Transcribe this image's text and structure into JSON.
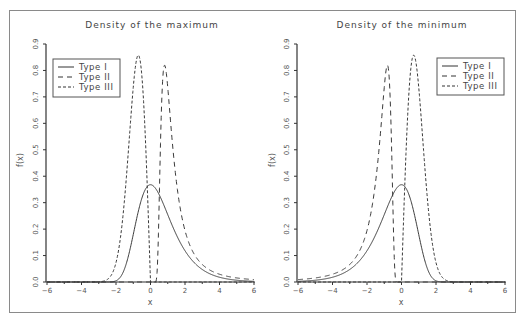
{
  "chart_data": [
    {
      "type": "line",
      "title": "Density of the maximum",
      "xlabel": "x",
      "ylabel": "f(x)",
      "xlim": [
        -6,
        6
      ],
      "ylim": [
        0,
        0.9
      ],
      "x_ticks": [
        -6,
        -4,
        -2,
        0,
        2,
        4,
        6
      ],
      "y_ticks": [
        "0.0",
        "0.1",
        "0.2",
        "0.3",
        "0.4",
        "0.5",
        "0.6",
        "0.7",
        "0.8",
        "0.9"
      ],
      "grid": false,
      "legend_position": "upper-left",
      "series": [
        {
          "name": "Type I",
          "style": "solid",
          "peak": {
            "x": 0.0,
            "y": 0.368
          },
          "x": [
            -3,
            -2,
            -1.5,
            -1,
            -0.5,
            0,
            0.5,
            1,
            1.5,
            2,
            3,
            4,
            5,
            6
          ],
          "values": [
            0.0,
            0.005,
            0.05,
            0.18,
            0.32,
            0.368,
            0.33,
            0.25,
            0.18,
            0.12,
            0.05,
            0.018,
            0.007,
            0.002
          ]
        },
        {
          "name": "Type II",
          "style": "long-dash",
          "peak": {
            "x": 0.82,
            "y": 0.82
          },
          "x": [
            0.3,
            0.4,
            0.5,
            0.6,
            0.7,
            0.82,
            1.0,
            1.2,
            1.5,
            2,
            3,
            4,
            5,
            6
          ],
          "values": [
            0.0,
            0.06,
            0.29,
            0.57,
            0.76,
            0.82,
            0.74,
            0.58,
            0.38,
            0.19,
            0.066,
            0.029,
            0.015,
            0.009
          ]
        },
        {
          "name": "Type III",
          "style": "short-dash",
          "peak": {
            "x": -0.71,
            "y": 0.86
          },
          "x": [
            -2.5,
            -2,
            -1.5,
            -1.2,
            -1,
            -0.71,
            -0.5,
            -0.3,
            0
          ],
          "values": [
            0.01,
            0.07,
            0.32,
            0.57,
            0.74,
            0.86,
            0.78,
            0.55,
            0.0
          ]
        }
      ]
    },
    {
      "type": "line",
      "title": "Density of the minimum",
      "xlabel": "x",
      "ylabel": "f(x)",
      "xlim": [
        -6,
        6
      ],
      "ylim": [
        0,
        0.9
      ],
      "x_ticks": [
        -6,
        -4,
        -2,
        0,
        2,
        4,
        6
      ],
      "y_ticks": [
        "0.0",
        "0.1",
        "0.2",
        "0.3",
        "0.4",
        "0.5",
        "0.6",
        "0.7",
        "0.8",
        "0.9"
      ],
      "grid": false,
      "legend_position": "upper-right",
      "series": [
        {
          "name": "Type I",
          "style": "solid",
          "peak": {
            "x": 0.0,
            "y": 0.368
          },
          "x": [
            -6,
            -5,
            -4,
            -3,
            -2,
            -1.5,
            -1,
            -0.5,
            0,
            0.5,
            1,
            1.5,
            2,
            3
          ],
          "values": [
            0.002,
            0.007,
            0.018,
            0.05,
            0.12,
            0.18,
            0.25,
            0.33,
            0.368,
            0.32,
            0.18,
            0.05,
            0.005,
            0.0
          ]
        },
        {
          "name": "Type II",
          "style": "long-dash",
          "peak": {
            "x": -0.82,
            "y": 0.82
          },
          "x": [
            -6,
            -5,
            -4,
            -3,
            -2,
            -1.5,
            -1.2,
            -1.0,
            -0.82,
            -0.7,
            -0.6,
            -0.5,
            -0.4,
            -0.3
          ],
          "values": [
            0.009,
            0.015,
            0.029,
            0.066,
            0.19,
            0.38,
            0.58,
            0.74,
            0.82,
            0.76,
            0.57,
            0.29,
            0.06,
            0.0
          ]
        },
        {
          "name": "Type III",
          "style": "short-dash",
          "peak": {
            "x": 0.71,
            "y": 0.86
          },
          "x": [
            0,
            0.3,
            0.5,
            0.71,
            1,
            1.2,
            1.5,
            2,
            2.5
          ],
          "values": [
            0.0,
            0.55,
            0.78,
            0.86,
            0.74,
            0.57,
            0.32,
            0.07,
            0.01
          ]
        }
      ]
    }
  ],
  "panels": [
    {
      "title": "Density of the maximum",
      "xlabel": "x",
      "ylabel": "f(x)",
      "x_tick_labels": [
        "−6",
        "−4",
        "−2",
        "0",
        "2",
        "4",
        "6"
      ],
      "y_tick_labels": [
        "0.0",
        "0.1",
        "0.2",
        "0.3",
        "0.4",
        "0.5",
        "0.6",
        "0.7",
        "0.8",
        "0.9"
      ],
      "legend": [
        "Type I",
        "Type II",
        "Type III"
      ]
    },
    {
      "title": "Density of the minimum",
      "xlabel": "x",
      "ylabel": "f(x)",
      "x_tick_labels": [
        "−6",
        "−4",
        "−2",
        "0",
        "2",
        "4",
        "6"
      ],
      "y_tick_labels": [
        "0.0",
        "0.1",
        "0.2",
        "0.3",
        "0.4",
        "0.5",
        "0.6",
        "0.7",
        "0.8",
        "0.9"
      ],
      "legend": [
        "Type I",
        "Type II",
        "Type III"
      ]
    }
  ],
  "colors": {
    "line": "#3a3a3a",
    "axis": "#333333",
    "frame": "#8a8a8a",
    "text": "#555555"
  }
}
